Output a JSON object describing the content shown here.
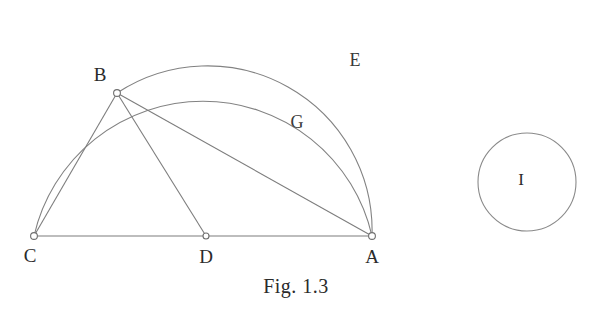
{
  "figure": {
    "caption": "Fig. 1.3",
    "background_color": "#ffffff",
    "stroke_color": "#7d7d7d",
    "label_color": "#2b2b2b"
  },
  "points": [
    {
      "id": "C",
      "label": "C",
      "x": 34,
      "y": 236,
      "label_x": 30,
      "label_y": 258
    },
    {
      "id": "D",
      "label": "D",
      "x": 206,
      "y": 236,
      "label_x": 206,
      "label_y": 259
    },
    {
      "id": "A",
      "label": "A",
      "x": 372,
      "y": 236,
      "label_x": 372,
      "label_y": 259
    },
    {
      "id": "B",
      "label": "B",
      "x": 117,
      "y": 93,
      "label_x": 100,
      "label_y": 77
    }
  ],
  "segments": [
    {
      "name": "base-line-CA",
      "from": "C",
      "to": "A"
    },
    {
      "name": "chord-CB",
      "from": "C",
      "to": "B"
    },
    {
      "name": "chord-BD",
      "from": "B",
      "to": "D"
    },
    {
      "name": "chord-BA",
      "from": "B",
      "to": "A"
    }
  ],
  "arcs": [
    {
      "name": "arc-E",
      "label": "E",
      "from": "C",
      "to": "A",
      "apex_x": 203,
      "apex_y": 24,
      "label_x": 355,
      "label_y": 62,
      "description": "outer semicircular arc on diameter CA passing through B"
    },
    {
      "name": "arc-G",
      "label": "G",
      "from": "B",
      "to": "A",
      "apex_x": 244,
      "apex_y": 70,
      "label_x": 297,
      "label_y": 124,
      "description": "inner arc from B to A"
    }
  ],
  "free_circle": {
    "name": "circle-I",
    "label": "I",
    "cx": 527,
    "cy": 182,
    "r": 49,
    "label_x": 521,
    "label_y": 181
  }
}
